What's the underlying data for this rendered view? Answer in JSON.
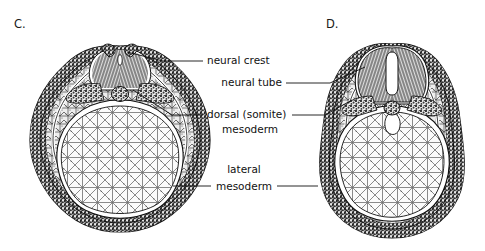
{
  "figure": {
    "background_color": "#ffffff",
    "ink_color": "#111111",
    "panels": [
      {
        "id": "C",
        "letter": "C.",
        "letter_x": 14,
        "letter_y": 28,
        "stage_note": "neural folds meeting; neural groove nearly closed",
        "center_x": 120,
        "center_y": 140,
        "radius_x": 92,
        "radius_y": 92
      },
      {
        "id": "D",
        "letter": "D.",
        "letter_x": 326,
        "letter_y": 28,
        "stage_note": "neural tube closed with slit lumen; embryo pear-shaped",
        "center_x": 392,
        "center_y": 150,
        "radius_x": 78,
        "radius_y": 86
      }
    ],
    "labels": [
      {
        "id": "neural-crest",
        "lines": [
          "neural crest"
        ],
        "text_x": 207,
        "text_y": 64,
        "align": "start",
        "leaders": [
          {
            "id": "neural-crest-to-C",
            "points": "203,61 163,61 127,52"
          }
        ]
      },
      {
        "id": "neural-tube",
        "lines": [
          "neural tube"
        ],
        "text_x": 282,
        "text_y": 86,
        "align": "end",
        "leaders": [
          {
            "id": "neural-tube-to-D",
            "points": "286,83 330,83 365,67"
          }
        ]
      },
      {
        "id": "dorsal-somite-mesoderm",
        "lines": [
          "dorsal (somite)",
          "mesoderm"
        ],
        "text_x": 207,
        "text_y": 118,
        "line_height": 15,
        "align": "start",
        "leaders": [
          {
            "id": "dorsal-mesoderm-to-C",
            "points": "203,115 172,115 133,90"
          },
          {
            "id": "dorsal-mesoderm-to-D",
            "points": "292,115 325,115 352,100"
          }
        ]
      },
      {
        "id": "lateral-mesoderm",
        "lines": [
          "lateral",
          "mesoderm"
        ],
        "text_x": 244,
        "text_y": 173,
        "line_height": 15,
        "align": "middle",
        "leaders": [
          {
            "id": "lateral-mesoderm-to-C",
            "points": "211,186 173,186"
          },
          {
            "id": "lateral-mesoderm-to-D",
            "points": "277,186 318,186"
          }
        ]
      }
    ],
    "structures": [
      "neural crest",
      "neural tube",
      "dorsal (somite) mesoderm",
      "lateral mesoderm",
      "notochord",
      "yolk mass endoderm",
      "ectoderm"
    ]
  }
}
